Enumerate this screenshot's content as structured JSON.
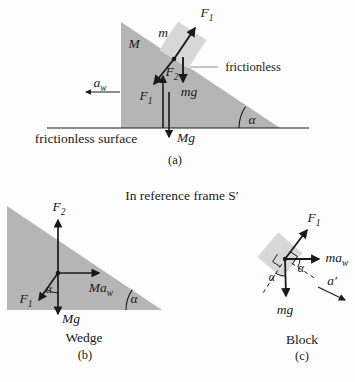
{
  "figure": {
    "background": "#fdfdfd",
    "ink": "#1a1a1a",
    "wedge_fill": "#b5b5b5",
    "block_fill": "#d7d7d7",
    "pointer_line_color": "#9a9a9a"
  },
  "frame_title": "In reference frame S′",
  "fig_a": {
    "caption": "(a)",
    "labels": {
      "F1_top": {
        "main": "F",
        "sub": "1"
      },
      "block_mass": "m",
      "wedge_mass": "M",
      "frictionless": "frictionless",
      "a_w": {
        "main": "a",
        "sub": "w"
      },
      "F2": {
        "main": "F",
        "sub": "2"
      },
      "F1_reaction": {
        "main": "F",
        "sub": "1"
      },
      "mg": "mg",
      "Mg": "Mg",
      "surface": "frictionless surface",
      "alpha": "α"
    }
  },
  "fig_b": {
    "name": "Wedge",
    "caption": "(b)",
    "labels": {
      "F2": {
        "main": "F",
        "sub": "2"
      },
      "Ma_w": {
        "main": "Ma",
        "sub": "w"
      },
      "F1": {
        "main": "F",
        "sub": "1"
      },
      "Mg": "Mg",
      "alpha_inner": "α",
      "alpha_corner": "α"
    }
  },
  "fig_c": {
    "name": "Block",
    "caption": "(c)",
    "labels": {
      "F1": {
        "main": "F",
        "sub": "1"
      },
      "ma_w": {
        "main": "ma",
        "sub": "w"
      },
      "mg": "mg",
      "a_prime": "a′",
      "alpha_right": "α",
      "alpha_left": "α"
    }
  }
}
